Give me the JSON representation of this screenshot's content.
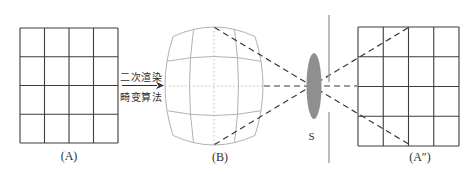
{
  "figure": {
    "panels": {
      "grid_a_label": "(A)",
      "grid_b_label": "(B)",
      "grid_a2_label": "(A″)",
      "lens_label": "S"
    },
    "process_arrow": {
      "text_top": "二次渲染",
      "text_bottom": "畸变算法"
    },
    "colors": {
      "grid_dark": "#3d3d3d",
      "grid_light": "#b2b2b2",
      "grid_center_light": "#bbbbbb",
      "dashed_ray": "#3a3a3a",
      "lens_fill": "#8f8f8f",
      "screen_line": "#999999",
      "text": "#2f2f2f",
      "background": "#ffffff"
    }
  }
}
